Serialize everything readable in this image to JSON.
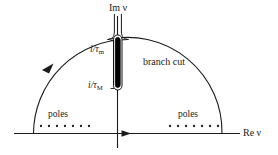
{
  "figure": {
    "name": "complex-nu-plane-contour",
    "background_color": "#ffffff",
    "line_color": "#1a1a1a",
    "cut_fill_color": "#000000",
    "width": 278,
    "height": 155
  },
  "axes": {
    "imaginary": {
      "label_prefix": "Im",
      "label_symbol": "ν",
      "label": "Im ν"
    },
    "real": {
      "label_prefix": "Re",
      "label_symbol": "ν",
      "label": "Re ν"
    }
  },
  "branch_cut": {
    "label": "branch cut",
    "upper_endpoint": {
      "numerator": "i",
      "denominator_symbol": "τ",
      "denominator_subscript": "m",
      "label": "i/τm"
    },
    "lower_endpoint": {
      "numerator": "i",
      "denominator_symbol": "τ",
      "denominator_subscript": "M",
      "label": "i/τM"
    }
  },
  "poles": {
    "left": {
      "label": "poles",
      "marker_count": 7
    },
    "right": {
      "label": "poles",
      "marker_count": 7
    }
  },
  "contour": {
    "direction_arrow_on_arc": "up-right",
    "direction_arrow_on_real_axis": "right"
  }
}
